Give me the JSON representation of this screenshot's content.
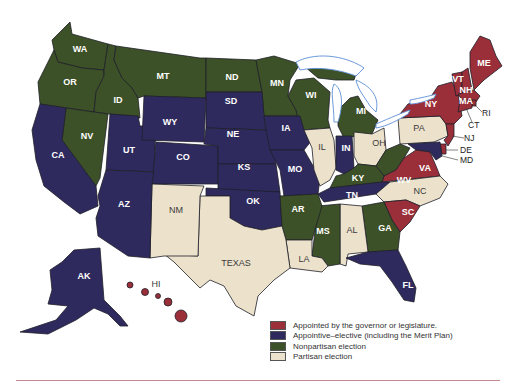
{
  "colors": {
    "appointed": "#9b2f39",
    "appointive_elective": "#2f2a5e",
    "nonpartisan": "#3c5127",
    "partisan": "#ece2cc",
    "lakes_outline": "#5b8fd6",
    "rule": "#c48a90"
  },
  "legend": {
    "items": [
      {
        "key": "appointed",
        "label": "Appointed by the governor or legislature."
      },
      {
        "key": "appointive_elective",
        "label": "Appointive–elective (including the Merit Plan)"
      },
      {
        "key": "nonpartisan",
        "label": "Nonpartisan election"
      },
      {
        "key": "partisan",
        "label": "Partisan election"
      }
    ]
  },
  "states": {
    "WA": "nonpartisan",
    "OR": "nonpartisan",
    "ID": "nonpartisan",
    "MT": "nonpartisan",
    "ND": "nonpartisan",
    "MN": "nonpartisan",
    "WI": "nonpartisan",
    "MI": "nonpartisan",
    "NV": "nonpartisan",
    "KY": "nonpartisan",
    "WV": "nonpartisan",
    "AR": "nonpartisan",
    "MS": "nonpartisan",
    "GA": "nonpartisan",
    "CA": "appointive_elective",
    "UT": "appointive_elective",
    "WY": "appointive_elective",
    "CO": "appointive_elective",
    "SD": "appointive_elective",
    "NE": "appointive_elective",
    "KS": "appointive_elective",
    "OK": "appointive_elective",
    "IA": "appointive_elective",
    "MO": "appointive_elective",
    "IN": "appointive_elective",
    "TN": "appointive_elective",
    "AZ": "appointive_elective",
    "FL": "appointive_elective",
    "AK": "appointive_elective",
    "MD": "appointive_elective",
    "NY": "appointed",
    "VT": "appointed",
    "NH": "appointed",
    "ME": "appointed",
    "MA": "appointed",
    "RI": "appointed",
    "CT": "appointed",
    "NJ": "appointed",
    "VA": "appointed",
    "SC": "appointed",
    "HI": "appointed",
    "DE": "appointed",
    "NM": "partisan",
    "TEXAS": "partisan",
    "IL": "partisan",
    "OH": "partisan",
    "PA": "partisan",
    "NC": "partisan",
    "AL": "partisan",
    "LA": "partisan"
  },
  "labels": {
    "WA": "WA",
    "OR": "OR",
    "ID": "ID",
    "MT": "MT",
    "ND": "ND",
    "MN": "MN",
    "WI": "WI",
    "MI": "MI",
    "NV": "NV",
    "CA": "CA",
    "UT": "UT",
    "WY": "WY",
    "CO": "CO",
    "SD": "SD",
    "NE": "NE",
    "KS": "KS",
    "OK": "OK",
    "IA": "IA",
    "MO": "MO",
    "IL": "IL",
    "IN": "IN",
    "OH": "OH",
    "PA": "PA",
    "NY": "NY",
    "VT": "VT",
    "NH": "NH",
    "ME": "ME",
    "MA": "MA",
    "RI": "RI",
    "CT": "CT",
    "NJ": "NJ",
    "DE": "DE",
    "MD": "MD",
    "WV": "WV",
    "VA": "VA",
    "KY": "KY",
    "TN": "TN",
    "NC": "NC",
    "SC": "SC",
    "GA": "GA",
    "AL": "AL",
    "MS": "MS",
    "AR": "AR",
    "LA": "LA",
    "TEXAS": "TEXAS",
    "NM": "NM",
    "AZ": "AZ",
    "FL": "FL",
    "AK": "AK",
    "HI": "HI"
  }
}
